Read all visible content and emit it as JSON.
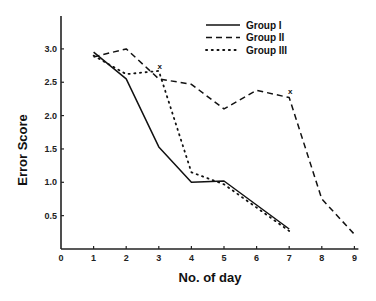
{
  "chart_data": {
    "type": "line",
    "title": "",
    "xlabel": "No. of day",
    "ylabel": "Error Score",
    "xlim": [
      0,
      9
    ],
    "ylim": [
      0,
      3.5
    ],
    "x_ticks": [
      "0",
      "1",
      "2",
      "3",
      "4",
      "5",
      "6",
      "7",
      "8",
      "9"
    ],
    "y_ticks": [
      "0.5",
      "1.0",
      "1.5",
      "2.0",
      "2.5",
      "3.0"
    ],
    "grid": false,
    "legend_position": "top-right",
    "series": [
      {
        "name": "Group I",
        "style": "solid",
        "x": [
          1,
          2,
          3,
          4,
          5,
          6,
          7
        ],
        "values": [
          2.95,
          2.55,
          1.53,
          1.0,
          1.02,
          0.66,
          0.3
        ]
      },
      {
        "name": "Group II",
        "style": "dashed",
        "x": [
          1,
          2,
          3,
          4,
          5,
          6,
          7,
          8,
          9
        ],
        "values": [
          2.88,
          3.0,
          2.55,
          2.47,
          2.1,
          2.38,
          2.27,
          0.75,
          0.22
        ]
      },
      {
        "name": "Group III",
        "style": "dotted",
        "x": [
          1,
          2,
          3,
          4,
          5,
          6,
          7
        ],
        "values": [
          2.9,
          2.62,
          2.67,
          1.15,
          0.97,
          0.62,
          0.27
        ]
      }
    ],
    "annotations": [
      {
        "text": "x",
        "x": 3,
        "y": 2.75
      },
      {
        "text": "x",
        "x": 7,
        "y": 2.37
      }
    ]
  },
  "legend": {
    "items": [
      {
        "label": "Group I"
      },
      {
        "label": "Group II"
      },
      {
        "label": "Group III"
      }
    ]
  },
  "axes": {
    "x_title": "No. of day",
    "y_title": "Error Score"
  }
}
